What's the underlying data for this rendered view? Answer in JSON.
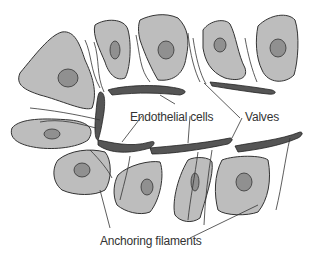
{
  "diagram": {
    "labels": {
      "endothelial": "Endothelial cells",
      "valves": "Valves",
      "anchoring": "Anchoring filaments"
    },
    "colors": {
      "tissue_cell": "#b9b9b9",
      "nucleus": "#8e8e8e",
      "vessel_wall": "#5a5a5a",
      "outline": "#333333"
    }
  }
}
